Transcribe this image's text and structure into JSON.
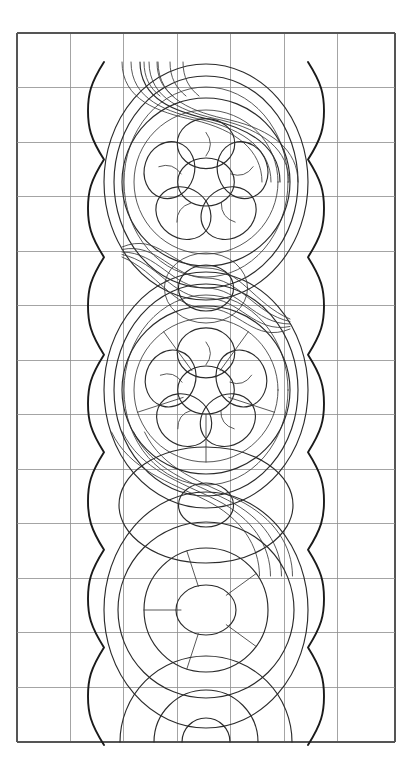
{
  "document": {
    "title": "Ornamental Band Pattern",
    "subject": "decorative-border-line-drawing",
    "medium": "pencil line drawing on graph paper",
    "background_color": "#ffffff"
  },
  "canvas": {
    "width": 412,
    "height": 775
  },
  "grid": {
    "name": "graph-paper-grid",
    "left": 17,
    "top": 33,
    "right": 395,
    "bottom": 742,
    "columns": 7,
    "rows": 13,
    "cell_width": 54,
    "cell_height": 54.5,
    "line_color": "#8d8d8d",
    "line_width": 0.8,
    "border_color": "#555555",
    "border_width": 1.1,
    "column_x": [
      17,
      70.4,
      123.8,
      177.2,
      230.6,
      284.0,
      337.4,
      395
    ],
    "row_y": [
      33,
      87.5,
      142,
      196.5,
      251,
      305.5,
      360,
      414.5,
      469,
      523.5,
      578,
      632.5,
      687,
      742
    ]
  },
  "ink": {
    "primary_color": "#1a1a1a",
    "secondary_color": "#2b2b2b",
    "light_color": "#3a3a3a",
    "heavy_width": 1.9,
    "medium_width": 1.15,
    "light_width": 0.85
  },
  "composition": {
    "axis_x": 206,
    "band_top": 62,
    "band_bottom": 745,
    "elements": [
      {
        "name": "scalloped-border-left",
        "type": "scallop-chain",
        "side": "left",
        "x_cusp": 104,
        "x_bulge": 88,
        "lobe_count": 7,
        "stroke": "heavy"
      },
      {
        "name": "scalloped-border-right",
        "type": "scallop-chain",
        "side": "right",
        "x_cusp": 308,
        "x_bulge": 324,
        "lobe_count": 7,
        "stroke": "heavy"
      },
      {
        "name": "rosette-upper",
        "type": "five-petal-flower",
        "cx": 206,
        "cy": 182,
        "outer_radius": 84,
        "petal_ring_radius": 62,
        "petal_radius": 25,
        "core_radius": 24,
        "petal_count": 5,
        "has_petal_veins": true,
        "has_radial_spokes": false
      },
      {
        "name": "rosette-lower",
        "type": "five-petal-flower",
        "cx": 206,
        "cy": 390,
        "outer_radius": 84,
        "petal_ring_radius": 60,
        "petal_radius": 25,
        "core_radius": 24,
        "petal_count": 5,
        "has_petal_veins": true,
        "has_radial_spokes": true
      },
      {
        "name": "center-boss-circle",
        "type": "circle",
        "cx": 206,
        "cy": 288,
        "radius": 23
      },
      {
        "name": "midsection-circle",
        "type": "circle",
        "cx": 206,
        "cy": 505,
        "radius": 22
      },
      {
        "name": "midsection-ring",
        "type": "circle",
        "cx": 206,
        "cy": 505,
        "radius": 58
      },
      {
        "name": "spoked-wheel",
        "type": "wheel",
        "cx": 206,
        "cy": 610,
        "outer_radius": 88,
        "inner_radius": 62,
        "hub_radius": 25,
        "spoke_count": 5
      },
      {
        "name": "ribbon-band-upper",
        "type": "s-curve-ribbon",
        "strands": 5,
        "span_y": [
          62,
          300
        ]
      },
      {
        "name": "ribbon-band-lower",
        "type": "s-curve-ribbon",
        "strands": 4,
        "span_y": [
          280,
          520
        ]
      },
      {
        "name": "base-arcs",
        "type": "nested-arcs",
        "cx": 206,
        "cy": 742,
        "radii": [
          86,
          52,
          24
        ]
      }
    ]
  },
  "legend": {
    "caption": ""
  }
}
